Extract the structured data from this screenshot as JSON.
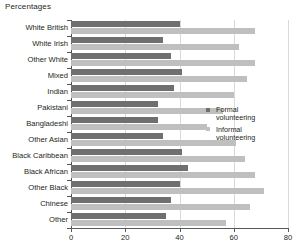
{
  "chart_data": {
    "type": "bar",
    "title": "Percentages",
    "orientation": "horizontal",
    "xlabel": "",
    "ylabel": "",
    "xlim": [
      0,
      80
    ],
    "xticks": [
      0,
      20,
      40,
      60,
      80
    ],
    "grid": true,
    "legend_position": "right",
    "categories": [
      "White British",
      "White Irish",
      "Other White",
      "Mixed",
      "Indian",
      "Pakistani",
      "Bangladeshi",
      "Other Asian",
      "Black Caribbean",
      "Black African",
      "Other Black",
      "Chinese",
      "Other"
    ],
    "series": [
      {
        "name": "Formal volunteering",
        "color": "#6f6f6f",
        "values": [
          40,
          34,
          37,
          41,
          38,
          32,
          32,
          34,
          41,
          43,
          40,
          37,
          35
        ]
      },
      {
        "name": "Informal volunteering",
        "color": "#bfbfbf",
        "values": [
          68,
          62,
          68,
          65,
          60,
          56,
          50,
          61,
          64,
          68,
          71,
          66,
          57
        ]
      }
    ]
  },
  "legend": {
    "items": [
      {
        "label": "Formal\nvolunteering"
      },
      {
        "label": "Informal\nvolunteering"
      }
    ]
  },
  "axis": {
    "tick_labels": [
      "0",
      "20",
      "40",
      "60",
      "80"
    ]
  }
}
